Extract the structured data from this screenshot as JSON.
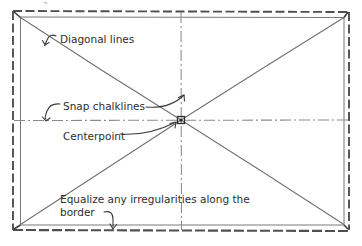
{
  "diagram": {
    "style": "hand-drawn pencil sketch",
    "background_color": "#ffffff",
    "ink_color": "#4a4a4a",
    "ink_color_dark": "#2b2b2b",
    "frame": {
      "name": "border-rectangle",
      "outer_edge_style": "dashed",
      "inner_edge_style": "solid",
      "x": 14,
      "y": 14,
      "width": 334,
      "height": 214
    },
    "centerpoint": {
      "x": 181,
      "y": 120,
      "marker": "small dark dot"
    },
    "chalklines": {
      "horizontal": {
        "y": 120,
        "style": "dash-dot"
      },
      "vertical": {
        "x": 181,
        "style": "dash-dot"
      }
    },
    "diagonals": [
      {
        "name": "diagonal-top-left-to-bottom-right",
        "style": "solid"
      },
      {
        "name": "diagonal-bottom-left-to-top-right",
        "style": "solid"
      }
    ],
    "annotations": [
      {
        "id": "diagonal-lines",
        "label": "Diagonal lines",
        "x": 58,
        "y": 42,
        "leader": "short hook arrow pointing left-down to diagonal"
      },
      {
        "id": "snap-chalklines",
        "label": "Snap chalklines",
        "x": 62,
        "y": 106,
        "leader": "curved arrows to horizontal chalkline and vertical chalkline"
      },
      {
        "id": "centerpoint",
        "label": "Centerpoint",
        "x": 62,
        "y": 138,
        "leader": "straight leader to centerpoint"
      },
      {
        "id": "equalize-border",
        "label_line_1": "Equalize any irregularities along the",
        "label_line_2": "border",
        "x": 60,
        "y": 201,
        "leader": "curved arrow pointing down to bottom border"
      }
    ]
  }
}
